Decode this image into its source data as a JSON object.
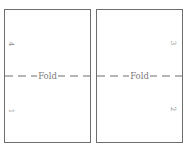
{
  "panels": [
    {
      "id": "left",
      "fold_label": "Fold",
      "page_top": "4",
      "page_bottom": "1"
    },
    {
      "id": "right",
      "fold_label": "Fold",
      "page_top": "3",
      "page_bottom": "2"
    }
  ],
  "colors": {
    "border": "#6e6e6e",
    "text": "#7a7a7a"
  }
}
